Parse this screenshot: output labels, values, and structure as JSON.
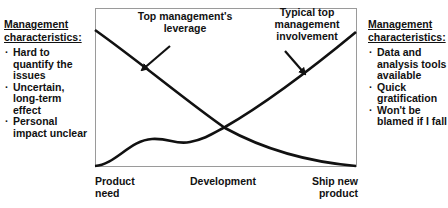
{
  "left_panel": {
    "heading": "Management characteristics:",
    "items": [
      "Hard to quantify the issues",
      "Uncertain, long-term effect",
      "Personal impact unclear"
    ]
  },
  "right_panel": {
    "heading": "Management characteristics:",
    "items": [
      "Data and analysis tools available",
      "Quick gratification",
      "Won't be blamed if I fall"
    ]
  },
  "diagram": {
    "curves": [
      {
        "name": "Top management's leverage",
        "trend": "decreasing"
      },
      {
        "name": "Typical top management involvement",
        "trend": "increasing with early bump"
      }
    ],
    "labels": {
      "leverage": "Top management's leverage",
      "involvement": "Typical top management involvement"
    },
    "x_axis": {
      "start": "Product need",
      "middle": "Development",
      "end": "Ship new product"
    },
    "colors": {
      "curve": "#111111",
      "frame": "#9a9a9a"
    }
  }
}
